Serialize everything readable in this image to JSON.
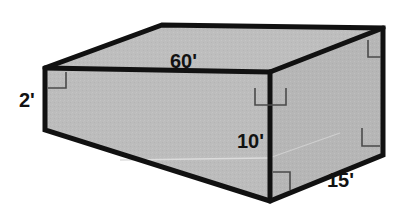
{
  "figure": {
    "type": "3d-rectangular-prism-diagram",
    "title": "",
    "shape_name": "rectangular box",
    "projection": "oblique",
    "background_color": "#ffffff",
    "face_fill_color": "#bcbcbc",
    "top_face_fill_color": "#bebebe",
    "right_face_fill_color": "#b6b6b6",
    "outline_color": "#111111",
    "outline_width_px": 5,
    "interior_line_color": "#3a3a3a",
    "right_angle_marker_color": "#4a4a4a",
    "units": "feet",
    "unit_symbol": "'"
  },
  "labels": {
    "length": "60'",
    "thickness": "2'",
    "height": "10'",
    "width": "15'"
  },
  "dimensions": [
    {
      "name": "length",
      "value": 60,
      "unit": "ft",
      "text": "60'",
      "edge": "top-back-horizontal"
    },
    {
      "name": "thickness",
      "value": 2,
      "unit": "ft",
      "text": "2'",
      "edge": "left-vertical"
    },
    {
      "name": "height",
      "value": 10,
      "unit": "ft",
      "text": "10'",
      "edge": "center-vertical"
    },
    {
      "name": "width",
      "value": 15,
      "unit": "ft",
      "text": "15'",
      "edge": "bottom-right-depth"
    }
  ],
  "right_angle_markers": [
    {
      "id": "marker-top-left-front",
      "vertex": "front-top-left"
    },
    {
      "id": "marker-top-right-back",
      "vertex": "back-top-right"
    },
    {
      "id": "marker-center-top",
      "vertex": "front-top-center"
    },
    {
      "id": "marker-center-bottom",
      "vertex": "front-bottom-center"
    },
    {
      "id": "marker-right-bottom",
      "vertex": "right-bottom"
    }
  ],
  "vertices": {
    "top_back_left": [
      162,
      25
    ],
    "top_back_right": [
      383,
      28
    ],
    "top_front_left": [
      45,
      68
    ],
    "top_front_right": [
      270,
      72
    ],
    "bottom_front_left": [
      45,
      130
    ],
    "bottom_front_right": [
      270,
      201
    ],
    "bottom_back_right": [
      383,
      155
    ]
  }
}
